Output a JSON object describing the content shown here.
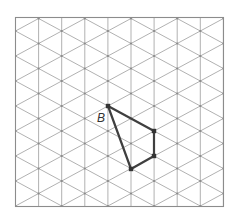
{
  "diagram": {
    "type": "isometric-grid",
    "frame": {
      "x": 15.5,
      "y": 17.5,
      "width": 208,
      "height": 189
    },
    "grid": {
      "column_spacing": 23.1,
      "row_spacing": 25,
      "column_count": 10,
      "even_column_first_node_y": 31,
      "odd_column_first_node_y": 19,
      "line_color": "#a8a8a8",
      "node_color": "#8a8a8a"
    },
    "shape": {
      "name": "quadrilateral",
      "edge_color": "#3f3f3f",
      "vertices": [
        {
          "col": 4,
          "x": 108,
          "y": 106,
          "label": "B"
        },
        {
          "col": 6,
          "x": 154,
          "y": 131,
          "label": ""
        },
        {
          "col": 6,
          "x": 154,
          "y": 156,
          "label": ""
        },
        {
          "col": 5,
          "x": 131,
          "y": 169,
          "label": ""
        }
      ]
    },
    "labels": [
      {
        "text": "B",
        "x": 97,
        "y": 122
      }
    ]
  }
}
